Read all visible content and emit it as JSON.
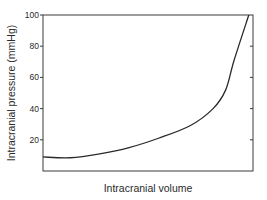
{
  "chart_data": {
    "type": "line",
    "title": "",
    "xlabel": "Intracranial volume",
    "ylabel": "Intracranial pressure (mmHg)",
    "ylim": [
      0,
      100
    ],
    "xlim": [
      0,
      100
    ],
    "x_ticks_labeled": false,
    "y_ticks": [
      20,
      40,
      60,
      80,
      100
    ],
    "y_tick_labels": [
      "20",
      "40",
      "60",
      "80",
      "100"
    ],
    "grid": false,
    "legend": null,
    "series": [
      {
        "name": "Pressure-volume curve",
        "x": [
          0,
          13,
          27,
          41,
          55,
          70,
          81,
          87,
          91,
          98
        ],
        "y": [
          9,
          8.5,
          11,
          15,
          21,
          29,
          40,
          52,
          71,
          100
        ]
      }
    ]
  },
  "colors": {
    "line": "#2a2a2a",
    "axis": "#3a3a3a",
    "background": "#ffffff"
  }
}
